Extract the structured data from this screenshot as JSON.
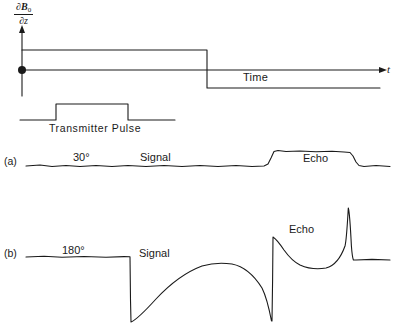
{
  "figure": {
    "background_color": "#ffffff",
    "stroke_color": "#1a1a1a",
    "width": 397,
    "height": 329
  },
  "axis": {
    "y_label_numerator_partial": "∂",
    "y_label_numerator_symbol": "B",
    "y_label_numerator_subscript": "0",
    "y_label_denominator_partial": "∂",
    "y_label_denominator_symbol": "z",
    "y_label_plain": "∂B₀/∂z",
    "x_axis_symbol": "t",
    "x_axis_name": "Time",
    "origin_marker": "filled-dot"
  },
  "gradient_trace": {
    "name": "field-gradient-waveform",
    "upper_level_y": 50,
    "lower_level_y": 88,
    "step_x": 207,
    "start_x": 22,
    "end_x": 380
  },
  "transmitter": {
    "label": "Transmitter Pulse",
    "baseline_y": 120,
    "top_y": 104,
    "rise_x": 56,
    "fall_x": 128,
    "start_x": 20,
    "end_x": 175
  },
  "rows": [
    {
      "tag": "(a)",
      "flip_angle": "30°",
      "signal_label": "Signal",
      "echo_label": "Echo",
      "baseline_y": 166,
      "echo_top_y": 150,
      "echo_start_x": 272,
      "echo_end_x": 355,
      "description": "Low flip angle: small FID, broad flat-topped echo plateau"
    },
    {
      "tag": "(b)",
      "flip_angle": "180°",
      "signal_label": "Signal",
      "echo_label": "Echo",
      "baseline_y": 257,
      "drop_x": 130,
      "drop_bottom_y": 322,
      "spike_x": 272,
      "spike_top_y": 235,
      "peak_x": 348,
      "peak_top_y": 208,
      "final_baseline_y": 260,
      "description": "Inversion 180° pulse: deep negative excursion, recovery arc, sharp spin echo"
    }
  ]
}
